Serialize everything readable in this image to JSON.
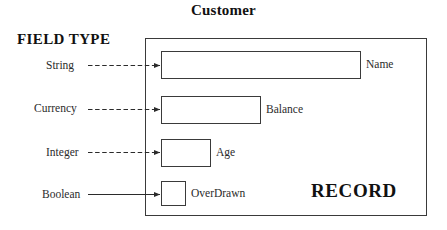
{
  "diagram": {
    "title": "Customer",
    "left_column_heading": "FIELD TYPE",
    "container_label": "RECORD",
    "container_kind": "record-box",
    "fields": [
      {
        "type": "String",
        "name": "Name",
        "connector": "dashed-arrow",
        "box_width_px": 200
      },
      {
        "type": "Currency",
        "name": "Balance",
        "connector": "dashed-arrow",
        "box_width_px": 100
      },
      {
        "type": "Integer",
        "name": "Age",
        "connector": "dashed-arrow",
        "box_width_px": 50
      },
      {
        "type": "Boolean",
        "name": "OverDrawn",
        "connector": "solid-arrow",
        "box_width_px": 25
      }
    ]
  },
  "colors": {
    "stroke": "#3a3a3a",
    "text": "#2b2b2b",
    "heading": "#111111",
    "background": "#ffffff"
  }
}
